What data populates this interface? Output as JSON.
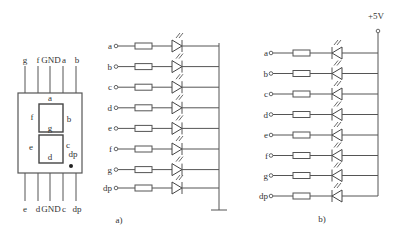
{
  "segment_display": {
    "top_pins": [
      "g",
      "f",
      "GND",
      "a",
      "b"
    ],
    "bottom_pins": [
      "e",
      "d",
      "GND",
      "c",
      "dp"
    ],
    "segment_labels": {
      "a": "a",
      "b": "b",
      "c": "c",
      "d": "d",
      "e": "e",
      "f": "f",
      "g": "g",
      "dp": "dp"
    }
  },
  "circuit_a": {
    "caption": "a)",
    "type": "common-cathode",
    "inputs": [
      "a",
      "b",
      "c",
      "d",
      "e",
      "f",
      "g",
      "dp"
    ],
    "common": "ground"
  },
  "circuit_b": {
    "caption": "b)",
    "type": "common-anode",
    "supply": "+5V",
    "inputs": [
      "a",
      "b",
      "c",
      "d",
      "e",
      "f",
      "g",
      "dp"
    ]
  }
}
